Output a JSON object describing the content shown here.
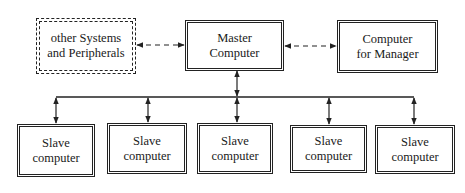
{
  "diagram": {
    "nodes": {
      "peripherals": {
        "label": "other Systems\nand Peripherals",
        "style": "dashed-double"
      },
      "master": {
        "label": "Master\nComputer",
        "style": "double"
      },
      "manager": {
        "label": "Computer\nfor Manager",
        "style": "double"
      },
      "slaves": [
        {
          "label": "Slave\ncomputer"
        },
        {
          "label": "Slave\ncomputer"
        },
        {
          "label": "Slave\ncomputer"
        },
        {
          "label": "Slave\ncomputer"
        },
        {
          "label": "Slave\ncomputer"
        }
      ]
    },
    "edges": [
      {
        "from": "peripherals",
        "to": "master",
        "style": "dashed",
        "direction": "bidirectional"
      },
      {
        "from": "master",
        "to": "manager",
        "style": "dashed",
        "direction": "bidirectional"
      },
      {
        "from": "master",
        "to": "bus",
        "style": "solid",
        "direction": "bidirectional"
      },
      {
        "from": "bus",
        "to": "slave-1",
        "style": "solid",
        "direction": "bidirectional"
      },
      {
        "from": "bus",
        "to": "slave-2",
        "style": "solid",
        "direction": "bidirectional"
      },
      {
        "from": "bus",
        "to": "slave-3",
        "style": "solid",
        "direction": "bidirectional"
      },
      {
        "from": "bus",
        "to": "slave-4",
        "style": "solid",
        "direction": "bidirectional"
      },
      {
        "from": "bus",
        "to": "slave-5",
        "style": "solid",
        "direction": "bidirectional"
      }
    ],
    "colors": {
      "line": "#222222",
      "background": "#ffffff"
    }
  }
}
